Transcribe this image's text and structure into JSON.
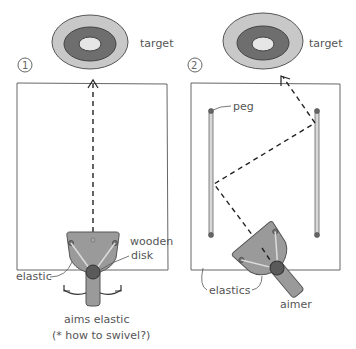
{
  "panels": [
    {
      "number": "1",
      "target_label": "target",
      "labels": {
        "wooden_line1": "wooden",
        "wooden_line2": "disk",
        "elastic": "elastic",
        "caption_line1": "aims elastic",
        "caption_line2": "(* how to swivel?)"
      }
    },
    {
      "number": "2",
      "target_label": "target",
      "labels": {
        "peg": "peg",
        "elastics": "elastics",
        "aimer": "aimer"
      }
    }
  ],
  "colors": {
    "outline": "#555555",
    "target_outer": "#c8c8c8",
    "target_mid": "#6e6e6e",
    "target_inner": "#e6e6e6",
    "aimer_fill": "#9a9a9a",
    "disk_fill": "#5a5a5a",
    "peg_fill": "#bdbdbd"
  }
}
